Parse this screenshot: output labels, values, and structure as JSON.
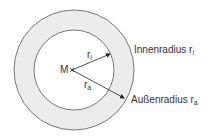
{
  "diagram": {
    "type": "annulus",
    "center_label": "M",
    "inner_radius_symbol": "r",
    "inner_radius_subscript": "i",
    "outer_radius_symbol": "r",
    "outer_radius_subscript": "a",
    "labels": {
      "inner": {
        "text": "Innenradius r",
        "subscript": "i"
      },
      "outer": {
        "text": "Außenradius r",
        "subscript": "a"
      }
    },
    "colors": {
      "ring_fill": "#ececec",
      "stroke": "#777777",
      "arrow": "#222222",
      "text": "#333333"
    }
  }
}
